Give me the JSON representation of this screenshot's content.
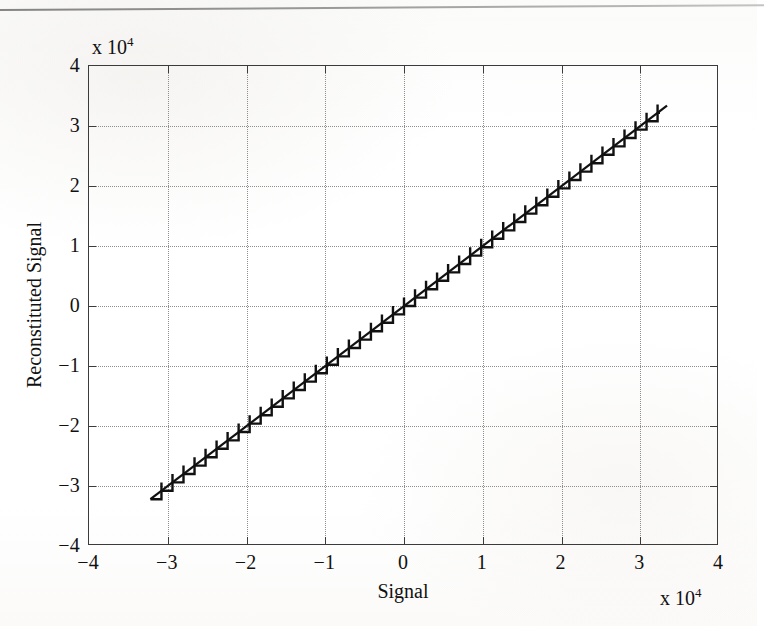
{
  "page": {
    "rule_present": true,
    "background_color": "#fdfdfc"
  },
  "figure": {
    "axis_color": "#3b3b3b",
    "grid_color": "#8e8e8e",
    "data_color": "#111111"
  },
  "labels": {
    "xlabel": "Signal",
    "ylabel": "Reconstituted Signal",
    "x_exponent_prefix": "x 10",
    "x_exponent_power": "4",
    "y_exponent_prefix": "x 10",
    "y_exponent_power": "4"
  },
  "chart_data": {
    "type": "line",
    "title": "",
    "xlabel": "Signal",
    "ylabel": "Reconstituted Signal",
    "xlim": [
      -40000,
      40000
    ],
    "ylim": [
      -40000,
      40000
    ],
    "x_exponent": 10000,
    "y_exponent": 10000,
    "grid": true,
    "grid_style": "dotted",
    "legend": "none",
    "xticks": [
      -4,
      -3,
      -2,
      -1,
      0,
      1,
      2,
      3,
      4
    ],
    "xticklabels": [
      "-4",
      "-3",
      "-2",
      "-1",
      "0",
      "1",
      "2",
      "3",
      "4"
    ],
    "yticks": [
      4,
      3,
      2,
      1,
      0,
      -1,
      -2,
      -3,
      -4
    ],
    "yticklabels": [
      "4",
      "3",
      "2",
      "1",
      "0",
      "-1",
      "-2",
      "-3",
      "-4"
    ],
    "series": [
      {
        "name": "Ideal (identity) line",
        "style": "solid",
        "x": [
          -32200,
          33400
        ],
        "y": [
          -32200,
          33400
        ]
      },
      {
        "name": "Quantized reconstitution (staircase)",
        "style": "staircase",
        "description": "Uniform quantizer transfer characteristic: staircase following y = x with step size ~1400",
        "x_start": -32200,
        "x_end": 32500,
        "y_start": -32200,
        "y_end": 33000,
        "step_size": 1400,
        "num_steps": 46
      }
    ]
  }
}
